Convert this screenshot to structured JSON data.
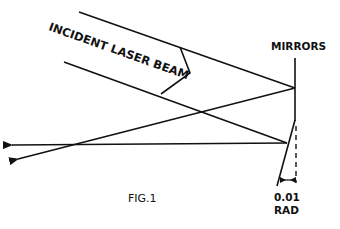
{
  "figure": {
    "caption": "FIG.1",
    "labels": {
      "incident_beam": "INCIDENT LASER BEAM",
      "mirrors": "MIRRORS",
      "angle_value": "0.01",
      "angle_unit": "RAD"
    },
    "colors": {
      "line": "#111111",
      "background": "#ffffff"
    }
  }
}
